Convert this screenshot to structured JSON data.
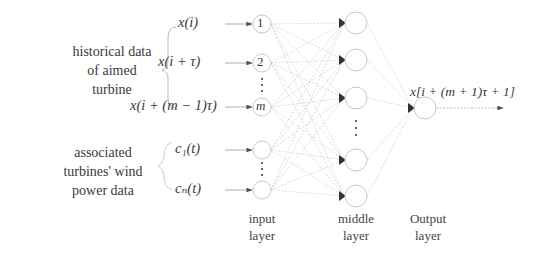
{
  "diagram": {
    "type": "neural-network",
    "groups": {
      "historical": {
        "label_lines": [
          "historical data",
          "of aimed",
          "turbine"
        ]
      },
      "associated": {
        "label_lines": [
          "associated",
          "turbines' wind",
          "power data"
        ]
      }
    },
    "inputs": [
      {
        "expr": "x(i)",
        "node_label": "1"
      },
      {
        "expr": "x(i + τ)",
        "node_label": "2"
      },
      {
        "expr": "x(i + (m − 1)τ)",
        "node_label": "m"
      },
      {
        "expr": "c₁(t)",
        "node_label": ""
      },
      {
        "expr": "cₙ(t)",
        "node_label": ""
      }
    ],
    "output": {
      "expr": "x[i + (m + 1)τ + 1]"
    },
    "layers": {
      "input": [
        "input",
        "layer"
      ],
      "middle": [
        "middle",
        "layer"
      ],
      "output": [
        "Output",
        "layer"
      ]
    },
    "colors": {
      "node_stroke": "#c8c8c8",
      "edge": "#bdbdbd",
      "arrow": "#555555",
      "text": "#3a3a3a"
    }
  }
}
